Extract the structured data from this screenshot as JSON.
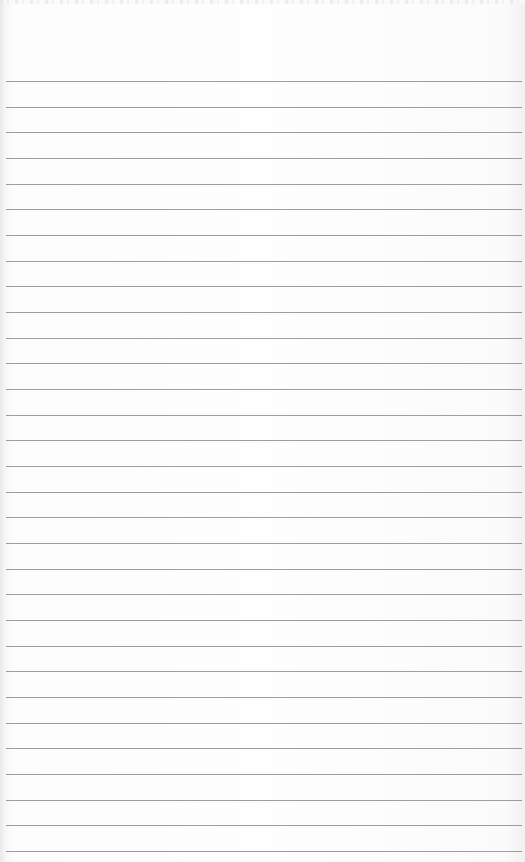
{
  "scene": {
    "description": "Blank sheet of ruled notebook paper",
    "paper_color": "#fdfdfd",
    "rule_color": "#8c8c8c",
    "rule_count": 31,
    "first_rule_y": 81,
    "rule_spacing": 25.67
  }
}
